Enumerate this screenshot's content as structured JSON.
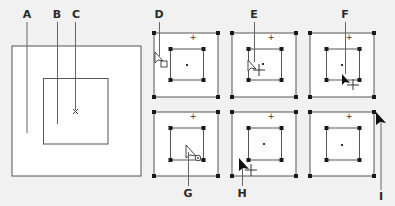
{
  "colors": {
    "background": "#f1f1f1",
    "frame": "#ffffff",
    "stroke": "#555555",
    "handle": "#1a1a1a",
    "leader": "#666666"
  },
  "labels": {
    "A": "A",
    "B": "B",
    "C": "C",
    "D": "D",
    "E": "E",
    "F": "F",
    "G": "G",
    "H": "H",
    "I": "I"
  },
  "diagram": {
    "main": {
      "outer_frame": "graphics-frame",
      "inner_content": "content",
      "center_mark": "content-center-point"
    },
    "panels": [
      {
        "id": "D",
        "cursor": "selection-arrow-with-frame-square",
        "position": "top-left"
      },
      {
        "id": "E",
        "cursor": "direct-selection-hollow-arrow-with-move",
        "position": "top-middle"
      },
      {
        "id": "F",
        "cursor": "selection-arrow-with-move",
        "position": "top-right"
      },
      {
        "id": "G",
        "cursor": "direct-selection-with-content-grabber",
        "position": "bottom-left"
      },
      {
        "id": "H",
        "cursor": "selection-arrow-with-move",
        "position": "bottom-middle"
      },
      {
        "id": "I",
        "cursor": "selection-arrow-on-corner-handle",
        "position": "bottom-right"
      }
    ]
  }
}
